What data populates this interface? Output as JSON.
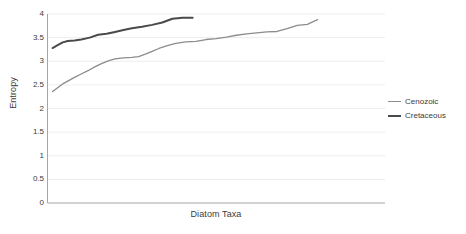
{
  "chart_data": {
    "type": "line",
    "title": "",
    "xlabel": "Diatom Taxa",
    "ylabel": "Entropy",
    "ylim": [
      0,
      4
    ],
    "yticks": [
      "0",
      "0.5",
      "1",
      "1.5",
      "2",
      "2.5",
      "3",
      "3.5",
      "4"
    ],
    "ytick_values": [
      0,
      0.5,
      1,
      1.5,
      2,
      2.5,
      3,
      3.5,
      4
    ],
    "xticks": [],
    "xtick_labels": [],
    "grid": "horizontal",
    "legend_position": "right",
    "xlim": [
      0,
      100
    ],
    "series": [
      {
        "name": "Cenozoic",
        "color": "#8c8c8c",
        "line_width": 1.3,
        "x": [
          1.5,
          3.0,
          4.5,
          6.0,
          8.0,
          10.0,
          12.0,
          14.0,
          16.0,
          18.0,
          20.0,
          22.5,
          25.0,
          27.0,
          29.0,
          31.0,
          33.0,
          35.5,
          38.0,
          41.0,
          44.0,
          47.0,
          50.0,
          53.0,
          56.0,
          59.0,
          62.0,
          65.0,
          68.0,
          71.0,
          74.0,
          77.0,
          80.0
        ],
        "y": [
          2.36,
          2.44,
          2.52,
          2.58,
          2.66,
          2.73,
          2.8,
          2.88,
          2.95,
          3.01,
          3.05,
          3.07,
          3.08,
          3.1,
          3.15,
          3.21,
          3.27,
          3.33,
          3.38,
          3.41,
          3.42,
          3.46,
          3.48,
          3.51,
          3.55,
          3.58,
          3.6,
          3.62,
          3.63,
          3.69,
          3.76,
          3.78,
          3.88
        ]
      },
      {
        "name": "Cretaceous",
        "color": "#4a4a4a",
        "line_width": 2.0,
        "x": [
          1.5,
          3.0,
          4.5,
          6.0,
          8.0,
          10.0,
          12.5,
          15.0,
          17.5,
          20.0,
          22.5,
          25.0,
          28.0,
          31.0,
          34.0,
          37.0,
          40.0,
          43.0
        ],
        "y": [
          3.28,
          3.34,
          3.4,
          3.43,
          3.44,
          3.46,
          3.5,
          3.56,
          3.58,
          3.62,
          3.66,
          3.7,
          3.73,
          3.77,
          3.82,
          3.9,
          3.92,
          3.92
        ]
      }
    ]
  },
  "axes": {
    "y_title": "Entropy",
    "x_title": "Diatom Taxa"
  },
  "legend": {
    "items": [
      {
        "label": "Cenozoic",
        "color": "#8c8c8c"
      },
      {
        "label": "Cretaceous",
        "color": "#4a4a4a"
      }
    ]
  },
  "colors": {
    "background": "#ffffff",
    "gridline": "#ededed",
    "axis": "#a6a6a6",
    "text": "#3b3b3b",
    "cenozoic": "#8c8c8c",
    "cretaceous": "#4a4a4a"
  }
}
